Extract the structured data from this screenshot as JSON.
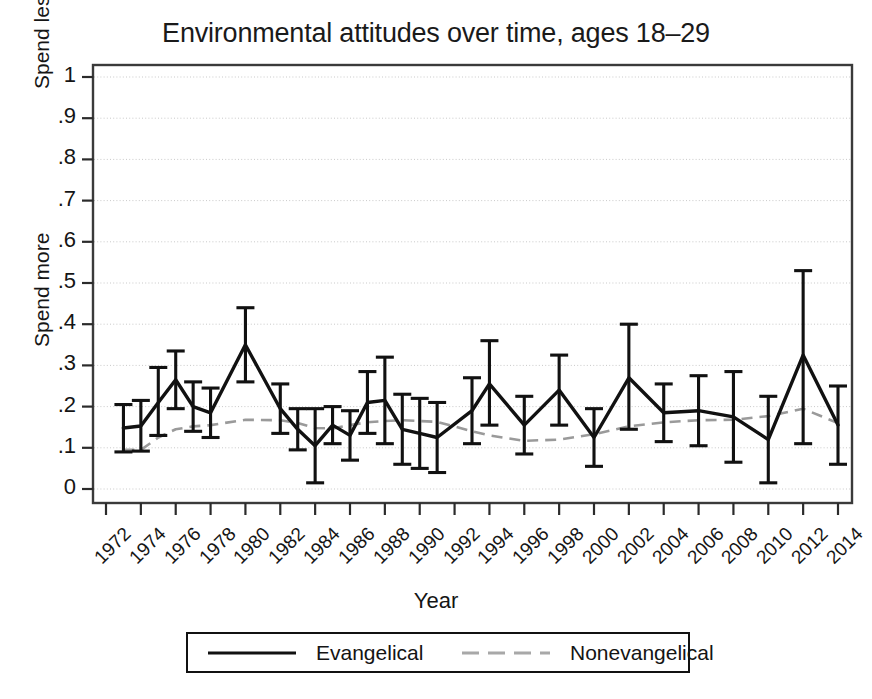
{
  "chart_data": {
    "type": "line",
    "title": "Environmental attitudes over time, ages 18–29",
    "xlabel": "Year",
    "ylabel": "",
    "ylim": [
      0,
      1
    ],
    "xlim": [
      1972,
      2014
    ],
    "grid": true,
    "legend_position": "bottom-outside",
    "y_axis_low_label": "Spend more",
    "y_axis_high_label": "Spend less",
    "ytick_labels": [
      "0",
      ".1",
      ".2",
      ".3",
      ".4",
      ".5",
      ".6",
      ".7",
      ".8",
      ".9",
      "1"
    ],
    "ytick_values": [
      0,
      0.1,
      0.2,
      0.3,
      0.4,
      0.5,
      0.6,
      0.7,
      0.8,
      0.9,
      1
    ],
    "xtick_labels": [
      "1972",
      "1974",
      "1976",
      "1978",
      "1980",
      "1982",
      "1984",
      "1986",
      "1988",
      "1990",
      "1992",
      "1994",
      "1996",
      "1998",
      "2000",
      "2002",
      "2004",
      "2006",
      "2008",
      "2010",
      "2012",
      "2014"
    ],
    "xtick_values": [
      1972,
      1974,
      1976,
      1978,
      1980,
      1982,
      1984,
      1986,
      1988,
      1990,
      1992,
      1994,
      1996,
      1998,
      2000,
      2002,
      2004,
      2006,
      2008,
      2010,
      2012,
      2014
    ],
    "series": [
      {
        "name": "Evangelical",
        "style": "solid",
        "color": "#111111",
        "has_error_bars": true,
        "x": [
          1973,
          1974,
          1975,
          1976,
          1977,
          1978,
          1980,
          1982,
          1983,
          1984,
          1985,
          1986,
          1987,
          1988,
          1989,
          1990,
          1991,
          1993,
          1994,
          1996,
          1998,
          2000,
          2002,
          2004,
          2006,
          2008,
          2010,
          2012,
          2014
        ],
        "values": [
          0.148,
          0.153,
          0.21,
          0.265,
          0.2,
          0.185,
          0.35,
          0.195,
          0.145,
          0.105,
          0.155,
          0.13,
          0.21,
          0.215,
          0.145,
          0.135,
          0.125,
          0.19,
          0.255,
          0.155,
          0.24,
          0.125,
          0.27,
          0.185,
          0.19,
          0.175,
          0.12,
          0.325,
          0.155
        ],
        "ci_low": [
          0.09,
          0.092,
          0.13,
          0.195,
          0.14,
          0.125,
          0.26,
          0.135,
          0.095,
          0.015,
          0.11,
          0.07,
          0.135,
          0.11,
          0.06,
          0.05,
          0.04,
          0.11,
          0.155,
          0.085,
          0.155,
          0.055,
          0.145,
          0.115,
          0.105,
          0.065,
          0.015,
          0.11,
          0.06
        ],
        "ci_high": [
          0.205,
          0.215,
          0.295,
          0.335,
          0.26,
          0.245,
          0.44,
          0.255,
          0.195,
          0.195,
          0.2,
          0.19,
          0.285,
          0.32,
          0.23,
          0.22,
          0.21,
          0.27,
          0.36,
          0.225,
          0.325,
          0.195,
          0.4,
          0.255,
          0.275,
          0.285,
          0.225,
          0.53,
          0.25
        ]
      },
      {
        "name": "Nonevangelical",
        "style": "dashed",
        "color": "#9a9a9a",
        "has_error_bars": false,
        "x": [
          1973,
          1974,
          1975,
          1976,
          1977,
          1978,
          1980,
          1982,
          1983,
          1984,
          1985,
          1986,
          1987,
          1988,
          1989,
          1990,
          1991,
          1993,
          1994,
          1996,
          1998,
          2000,
          2002,
          2004,
          2006,
          2008,
          2010,
          2012,
          2014
        ],
        "values": [
          0.095,
          0.095,
          0.125,
          0.145,
          0.152,
          0.155,
          0.168,
          0.167,
          0.16,
          0.148,
          0.147,
          0.155,
          0.162,
          0.165,
          0.167,
          0.165,
          0.163,
          0.14,
          0.13,
          0.117,
          0.12,
          0.133,
          0.152,
          0.162,
          0.167,
          0.168,
          0.177,
          0.195,
          0.16
        ]
      }
    ]
  },
  "legend": {
    "entries": [
      {
        "label": "Evangelical",
        "key": "solid-line-key"
      },
      {
        "label": "Nonevangelical",
        "key": "dashed-line-key"
      }
    ]
  }
}
